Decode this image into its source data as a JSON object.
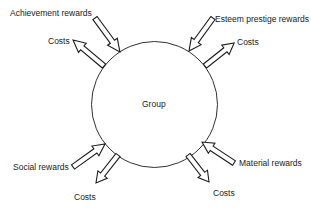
{
  "diagram": {
    "center": {
      "label": "Group"
    },
    "colors": {
      "stroke": "#1a1a1a",
      "fill": "#ffffff",
      "text": "#1a1a1a"
    },
    "flows": [
      {
        "id": "achievement",
        "label": "Achievement rewards",
        "direction": "in"
      },
      {
        "id": "cost-top-left",
        "label": "Costs",
        "direction": "out"
      },
      {
        "id": "esteem",
        "label": "Esteem prestige rewards",
        "direction": "in"
      },
      {
        "id": "cost-top-right",
        "label": "Costs",
        "direction": "out"
      },
      {
        "id": "social",
        "label": "Social rewards",
        "direction": "in"
      },
      {
        "id": "cost-bottom-left",
        "label": "Costs",
        "direction": "out"
      },
      {
        "id": "material",
        "label": "Material rewards",
        "direction": "in"
      },
      {
        "id": "cost-bottom-right",
        "label": "Costs",
        "direction": "out"
      }
    ]
  }
}
